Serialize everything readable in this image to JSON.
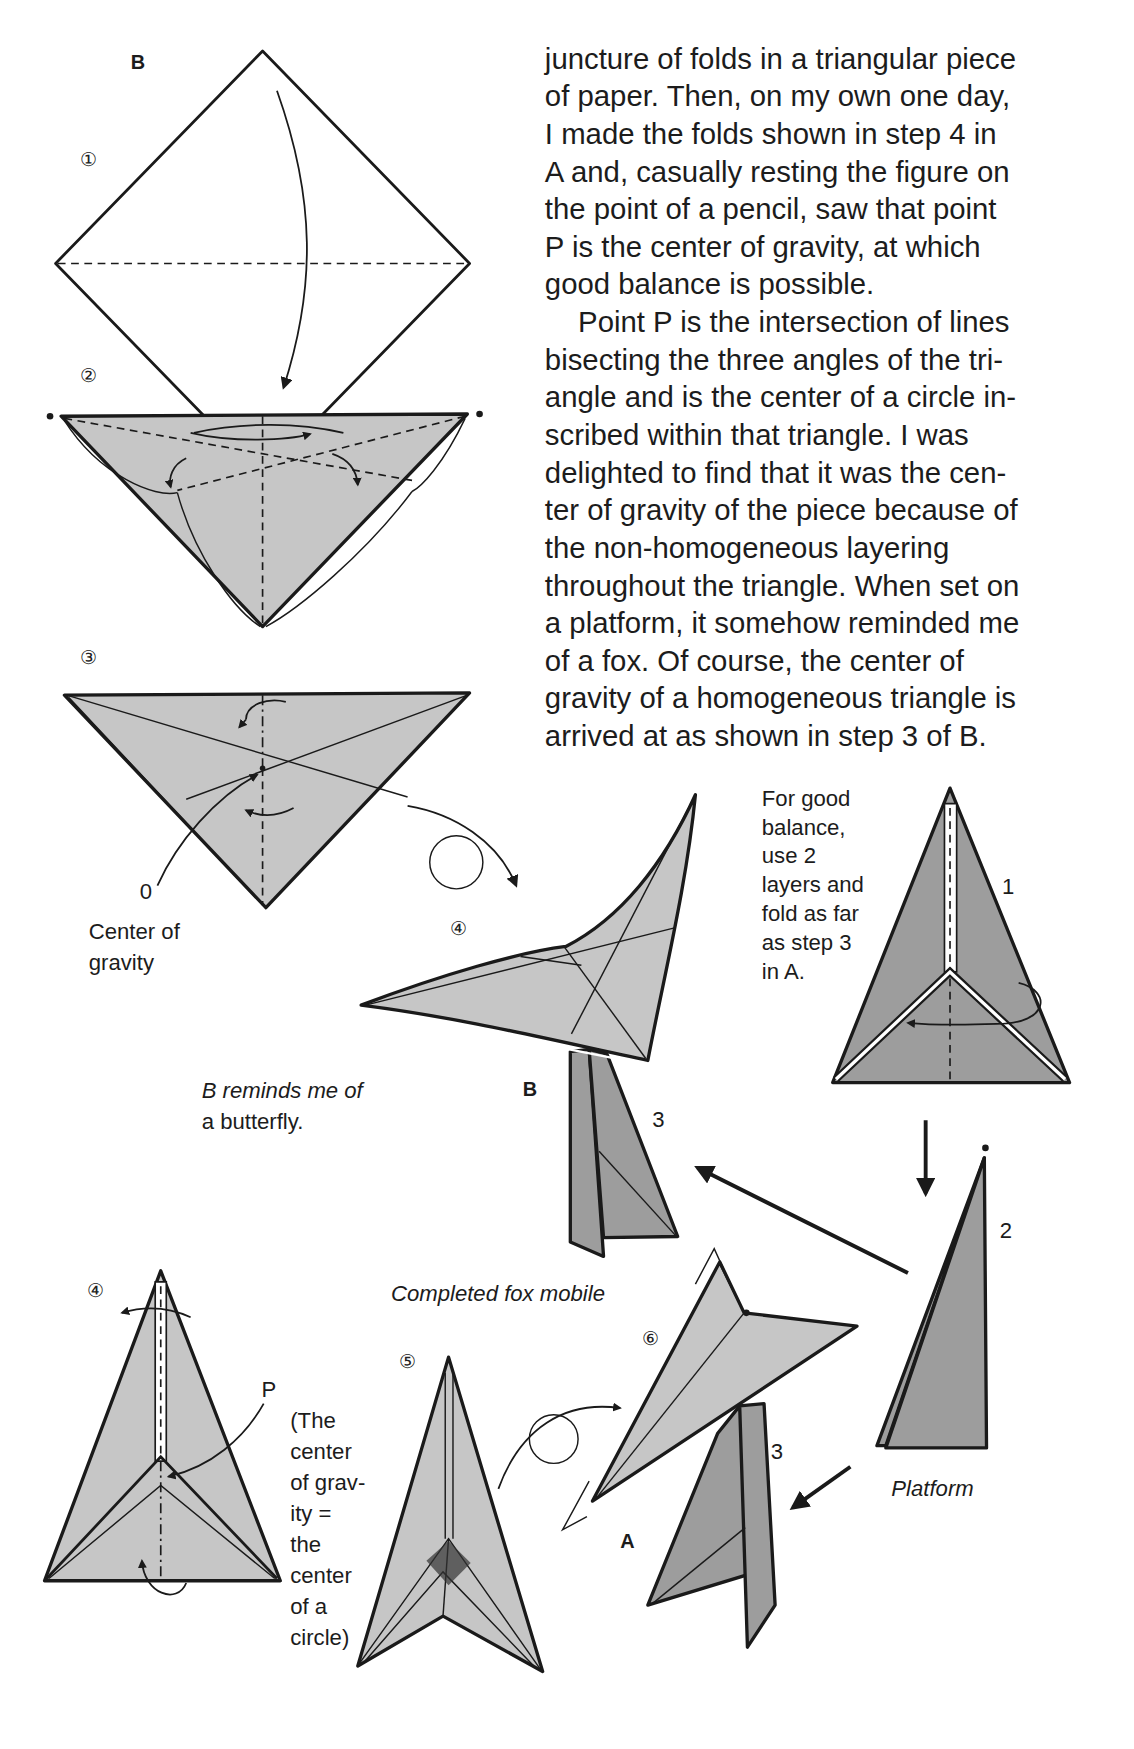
{
  "body_text": {
    "lines": [
      "juncture of folds in a triangular piece",
      "of paper. Then, on my own one day,",
      "I made the folds shown in step 4 in",
      "A and, casually resting the figure on",
      "the point of a pencil, saw that point",
      "P is the center of gravity, at which",
      "good balance is possible.",
      "Point P is the intersection of lines",
      "bisecting the three angles of the tri-",
      "angle and is the center of a circle in-",
      "scribed within that triangle. I was",
      "delighted to find that it was the cen-",
      "ter of gravity of the piece because of",
      "the non-homogeneous layering",
      "throughout the triangle. When set on",
      "a platform, it somehow reminded me",
      "of a fox. Of course, the center of",
      "gravity of a homogeneous triangle is",
      "arrived at as shown in step 3 of B."
    ]
  },
  "section_b": {
    "label": "B",
    "steps": [
      "①",
      "②",
      "③",
      "④"
    ],
    "center_of_gravity_marker": "0",
    "center_of_gravity_caption": [
      "Center of",
      "gravity"
    ],
    "butterfly_caption": [
      "B reminds me of",
      "a butterfly."
    ]
  },
  "mobile": {
    "caption": "Completed fox mobile",
    "label_b": "B",
    "label_a": "A",
    "stand_numbers": [
      "1",
      "2",
      "3",
      "3"
    ],
    "platform_caption": "Platform",
    "balance_note": [
      "For good",
      "balance,",
      "use 2",
      "layers and",
      "fold as far",
      "as step 3",
      "in A."
    ]
  },
  "section_a": {
    "steps": [
      "④",
      "⑤",
      "⑥"
    ],
    "point_label": "P",
    "note": [
      "(The",
      "center",
      "of grav-",
      "ity =",
      "the",
      "center",
      "of a",
      "circle)"
    ]
  },
  "colors": {
    "paper_light": "#c6c6c6",
    "paper_dark": "#9d9d9d",
    "ink": "#1a1a1a",
    "background": "#ffffff"
  }
}
